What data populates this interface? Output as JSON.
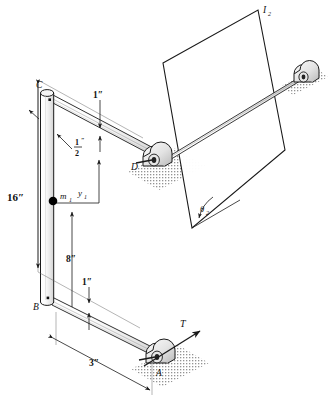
{
  "figure": {
    "background_color": "#ffffff",
    "line_color": "#1a1a1a",
    "hatch_color": "#9a9a9a",
    "mass_color": "#000000"
  },
  "labels": {
    "point_a": "A",
    "point_b": "B",
    "point_c": "C",
    "point_d": "D",
    "mass_1": "m",
    "mass_1_sub": "1",
    "inertia_2": "I",
    "inertia_2_sub": "2",
    "theta_2": "θ",
    "theta_2_sub": "2",
    "y_1": "y",
    "y_1_sub": "1",
    "torque_t": "T"
  },
  "dimensions": {
    "height_16": "16″",
    "length_8": "8″",
    "length_3": "3″",
    "top_rod_1": "1″",
    "bottom_rod_1": "1″",
    "half_num": "1",
    "half_den": "2",
    "half_mark": "″"
  },
  "geometry": {
    "vertical_rod": {
      "top_x": 47,
      "top_y": 91,
      "bottom_x": 47,
      "bottom_y": 305,
      "width": 13
    },
    "upper_arm": {
      "from_x": 58,
      "from_y": 98,
      "to_x": 160,
      "to_y": 160
    },
    "lower_arm": {
      "from_x": 58,
      "from_y": 300,
      "to_x": 162,
      "to_y": 358
    },
    "shaft": {
      "from_x": 165,
      "from_y": 157,
      "to_x": 302,
      "to_y": 76
    },
    "plate_corners": [
      [
        163,
        63
      ],
      [
        258,
        10
      ],
      [
        285,
        150
      ],
      [
        192,
        228
      ]
    ],
    "mass_point": {
      "x": 53,
      "y": 201
    },
    "bearing_d": {
      "x": 157,
      "y": 160
    },
    "bearing_a": {
      "x": 159,
      "y": 357
    },
    "bearing_right": {
      "x": 301,
      "y": 74
    }
  }
}
